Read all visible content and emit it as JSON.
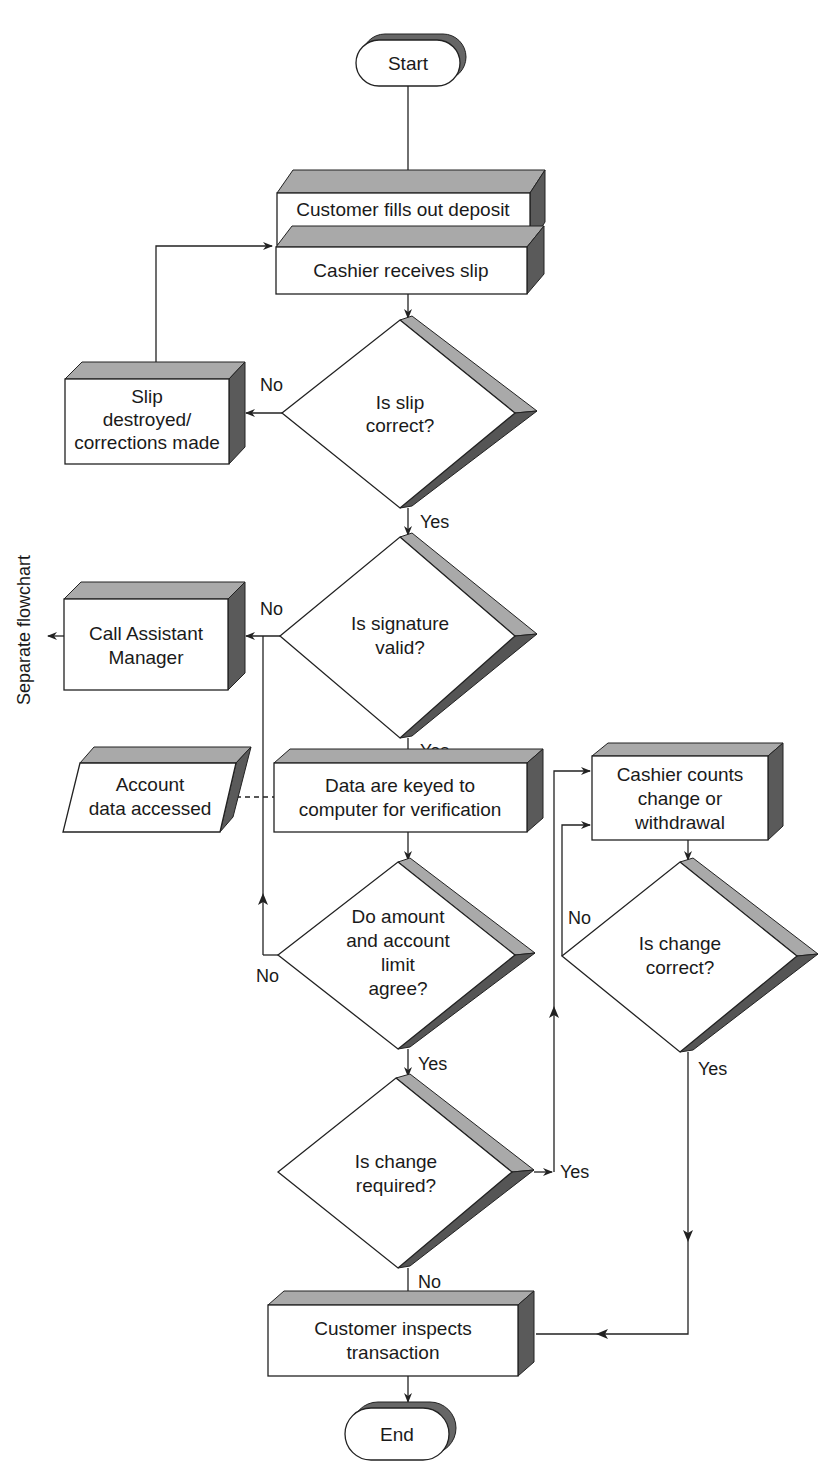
{
  "diagram": {
    "type": "flowchart",
    "nodes": {
      "start": {
        "shape": "terminator",
        "label": "Start"
      },
      "fill_slip": {
        "shape": "process",
        "lines": [
          "Customer fills out deposit",
          "or withdrawal slip"
        ]
      },
      "receive_slip": {
        "shape": "process",
        "lines": [
          "Cashier receives slip"
        ]
      },
      "slip_correct": {
        "shape": "decision",
        "lines": [
          "Is slip",
          "correct?"
        ]
      },
      "slip_destroyed": {
        "shape": "process",
        "lines": [
          "Slip",
          "destroyed/",
          "corrections made"
        ]
      },
      "signature_valid": {
        "shape": "decision",
        "lines": [
          "Is signature",
          "valid?"
        ]
      },
      "call_manager": {
        "shape": "process",
        "lines": [
          "Call Assistant",
          "Manager"
        ]
      },
      "account_data": {
        "shape": "data",
        "lines": [
          "Account",
          "data accessed"
        ]
      },
      "keyed": {
        "shape": "process",
        "lines": [
          "Data are keyed to",
          "computer for verification"
        ]
      },
      "amount_agree": {
        "shape": "decision",
        "lines": [
          "Do amount",
          "and account",
          "limit",
          "agree?"
        ]
      },
      "change_required": {
        "shape": "decision",
        "lines": [
          "Is change",
          "required?"
        ]
      },
      "cashier_counts": {
        "shape": "process",
        "lines": [
          "Cashier counts",
          "change or",
          "withdrawal"
        ]
      },
      "change_correct": {
        "shape": "decision",
        "lines": [
          "Is change",
          "correct?"
        ]
      },
      "inspect": {
        "shape": "process",
        "lines": [
          "Customer inspects",
          "transaction"
        ]
      },
      "end": {
        "shape": "terminator",
        "label": "End"
      }
    },
    "edge_labels": {
      "slip_no": "No",
      "slip_yes": "Yes",
      "sig_no": "No",
      "sig_yes": "Yes",
      "amount_no": "No",
      "amount_yes": "Yes",
      "change_req_yes": "Yes",
      "change_req_no": "No",
      "change_correct_no": "No",
      "change_correct_yes": "Yes"
    },
    "side_note": "Separate flowchart",
    "colors": {
      "line": "#222222",
      "top_face": "#a9a9a9",
      "side_face": "#5a5a5a",
      "front_face": "#ffffff"
    }
  }
}
